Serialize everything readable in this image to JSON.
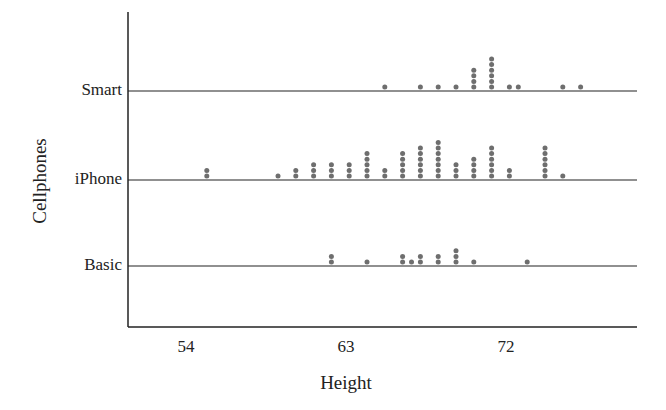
{
  "chart_data": {
    "type": "scatter",
    "subtype": "dotplot",
    "title": "",
    "xlabel": "Height",
    "ylabel": "Cellphones",
    "x_ticks": [
      54,
      63,
      72
    ],
    "xlim": [
      51.7,
      80.5
    ],
    "categories": [
      "Smart",
      "iPhone",
      "Basic"
    ],
    "series": [
      {
        "name": "Smart",
        "points": [
          {
            "x": 65,
            "count": 1
          },
          {
            "x": 67,
            "count": 1
          },
          {
            "x": 68,
            "count": 1
          },
          {
            "x": 69,
            "count": 1
          },
          {
            "x": 70,
            "count": 4
          },
          {
            "x": 71,
            "count": 6
          },
          {
            "x": 72,
            "count": 1
          },
          {
            "x": 72.5,
            "count": 1
          },
          {
            "x": 75,
            "count": 1
          },
          {
            "x": 76,
            "count": 1
          }
        ]
      },
      {
        "name": "iPhone",
        "points": [
          {
            "x": 55,
            "count": 2
          },
          {
            "x": 59,
            "count": 1
          },
          {
            "x": 60,
            "count": 2
          },
          {
            "x": 61,
            "count": 3
          },
          {
            "x": 62,
            "count": 3
          },
          {
            "x": 63,
            "count": 3
          },
          {
            "x": 64,
            "count": 5
          },
          {
            "x": 65,
            "count": 2
          },
          {
            "x": 66,
            "count": 5
          },
          {
            "x": 67,
            "count": 6
          },
          {
            "x": 68,
            "count": 7
          },
          {
            "x": 69,
            "count": 3
          },
          {
            "x": 70,
            "count": 4
          },
          {
            "x": 71,
            "count": 6
          },
          {
            "x": 72,
            "count": 2
          },
          {
            "x": 74,
            "count": 6
          },
          {
            "x": 75,
            "count": 1
          }
        ]
      },
      {
        "name": "Basic",
        "points": [
          {
            "x": 62,
            "count": 2
          },
          {
            "x": 64,
            "count": 1
          },
          {
            "x": 66,
            "count": 2
          },
          {
            "x": 66.5,
            "count": 1
          },
          {
            "x": 67,
            "count": 2
          },
          {
            "x": 68,
            "count": 2
          },
          {
            "x": 69,
            "count": 3
          },
          {
            "x": 70,
            "count": 1
          },
          {
            "x": 73,
            "count": 1
          }
        ]
      }
    ],
    "grid": false,
    "legend": null,
    "colors": {
      "dot": "#6e6e6e",
      "axis": "#222222"
    }
  }
}
